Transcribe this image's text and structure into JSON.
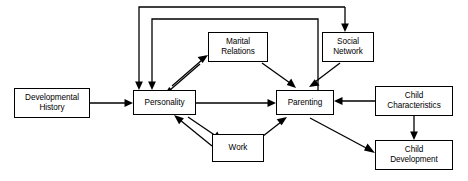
{
  "diagram": {
    "type": "flowchart",
    "canvas": {
      "width": 468,
      "height": 181,
      "background": "#ffffff"
    },
    "stroke_color": "#000000",
    "box_fill": "#ffffff",
    "nodes": [
      {
        "id": "developmental-history",
        "label": "Developmental\nHistory",
        "x": 14,
        "y": 88,
        "w": 76,
        "h": 30
      },
      {
        "id": "personality",
        "label": "Personality",
        "x": 133,
        "y": 90,
        "w": 63,
        "h": 25
      },
      {
        "id": "marital-relations",
        "label": "Marital\nRelations",
        "x": 208,
        "y": 32,
        "w": 60,
        "h": 30
      },
      {
        "id": "social-network",
        "label": "Social\nNetwork",
        "x": 322,
        "y": 32,
        "w": 52,
        "h": 30
      },
      {
        "id": "parenting",
        "label": "Parenting",
        "x": 276,
        "y": 90,
        "w": 58,
        "h": 25
      },
      {
        "id": "work",
        "label": "Work",
        "x": 212,
        "y": 134,
        "w": 52,
        "h": 28
      },
      {
        "id": "child-characteristics",
        "label": "Child\nCharacteristics",
        "x": 375,
        "y": 86,
        "w": 78,
        "h": 30
      },
      {
        "id": "child-development",
        "label": "Child\nDevelopment",
        "x": 375,
        "y": 140,
        "w": 78,
        "h": 30
      }
    ],
    "edges": [
      {
        "id": "dev-history-to-personality",
        "from": "developmental-history",
        "to": "personality",
        "style": "straight"
      },
      {
        "id": "personality-to-marital",
        "from": "personality",
        "to": "marital-relations",
        "style": "straight"
      },
      {
        "id": "marital-to-personality",
        "from": "marital-relations",
        "to": "personality",
        "style": "straight"
      },
      {
        "id": "marital-to-parenting",
        "from": "marital-relations",
        "to": "parenting",
        "style": "straight"
      },
      {
        "id": "personality-to-parenting",
        "from": "personality",
        "to": "parenting",
        "style": "straight"
      },
      {
        "id": "personality-to-work",
        "from": "personality",
        "to": "work",
        "style": "straight"
      },
      {
        "id": "work-to-personality",
        "from": "work",
        "to": "personality",
        "style": "straight"
      },
      {
        "id": "work-to-parenting",
        "from": "work",
        "to": "parenting",
        "style": "straight"
      },
      {
        "id": "social-network-to-parenting",
        "from": "social-network",
        "to": "parenting",
        "style": "straight"
      },
      {
        "id": "child-characteristics-to-parenting",
        "from": "child-characteristics",
        "to": "parenting",
        "style": "straight"
      },
      {
        "id": "child-characteristics-to-child-development",
        "from": "child-characteristics",
        "to": "child-development",
        "style": "straight"
      },
      {
        "id": "parenting-to-child-development",
        "from": "parenting",
        "to": "child-development",
        "style": "straight"
      },
      {
        "id": "parenting-to-social-network-feedback",
        "from": "parenting",
        "to": "social-network",
        "style": "orthogonal-top-outer"
      },
      {
        "id": "parenting-to-personality-feedback-outer",
        "from": "parenting",
        "to": "personality",
        "style": "orthogonal-top-outer"
      },
      {
        "id": "parenting-to-personality-feedback-inner",
        "from": "parenting",
        "to": "personality",
        "style": "orthogonal-top-inner"
      }
    ]
  }
}
